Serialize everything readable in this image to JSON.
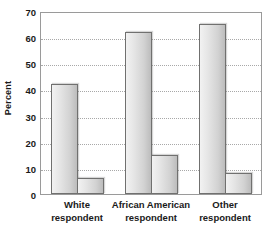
{
  "chart_data": {
    "type": "bar",
    "title": "",
    "xlabel": "",
    "ylabel": "Percent",
    "ylim": [
      0,
      70
    ],
    "yticks": [
      0,
      10,
      20,
      30,
      40,
      50,
      60,
      70
    ],
    "ytick_labels": [
      "0",
      "10",
      "20",
      "30",
      "40",
      "50",
      "60",
      "70"
    ],
    "grid": true,
    "legend": "none",
    "categories": [
      "White respondent",
      "African American respondent",
      "Other respondent"
    ],
    "category_lines": [
      [
        "White",
        "respondent"
      ],
      [
        "African American",
        "respondent"
      ],
      [
        "Other",
        "respondent"
      ]
    ],
    "series": [
      {
        "name": "series-1",
        "values": [
          42,
          62,
          65
        ]
      },
      {
        "name": "series-2",
        "values": [
          6,
          15,
          8
        ]
      }
    ],
    "colors": {
      "bar_fill_light": "#f2f2f2",
      "bar_fill_dark": "#bcbcbc",
      "bar_border": "#70706f",
      "gridline": "#a8a8a8",
      "frame": "#9a9a9a",
      "text": "#1a1a1a",
      "background": "#ffffff"
    }
  },
  "axes": {
    "y_title": "Percent"
  }
}
